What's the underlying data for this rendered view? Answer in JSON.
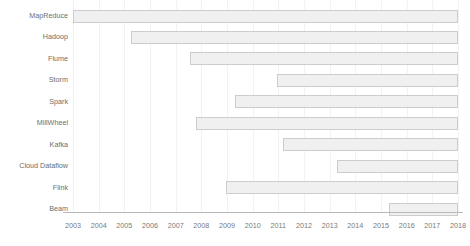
{
  "chart_data": {
    "type": "bar",
    "subtype": "gantt-timeline",
    "title": "",
    "subtitle": "",
    "xlabel": "",
    "ylabel": "",
    "orientation": "horizontal",
    "grid": true,
    "legend": false,
    "legend_position": "none",
    "xlim": [
      2002.4,
      2018.6
    ],
    "xticks": [
      2003,
      2004,
      2005,
      2006,
      2007,
      2008,
      2009,
      2010,
      2011,
      2012,
      2013,
      2014,
      2015,
      2016,
      2017,
      2018
    ],
    "xtick_labels": [
      "2003",
      "2004",
      "2005",
      "2006",
      "2007",
      "2008",
      "2009",
      "2010",
      "2011",
      "2012",
      "2013",
      "2014",
      "2015",
      "2016",
      "2017",
      "2018"
    ],
    "categories": [
      "MapReduce",
      "Hadoop",
      "Flume",
      "Storm",
      "Spark",
      "MillWheel",
      "Kafka",
      "Cloud Dataflow",
      "Flink",
      "Beam"
    ],
    "bar_color": "#f0f0f0",
    "bar_border_color": "#cccccc",
    "grid_color": "#f2f2f2",
    "axis_color": "#b9b9b9",
    "label_color": "#6d6d6d",
    "bars": [
      {
        "label": "MapReduce",
        "start": 2003.0,
        "end": 2018.0
      },
      {
        "label": "Hadoop",
        "start": 2005.25,
        "end": 2018.0
      },
      {
        "label": "Flume",
        "start": 2007.55,
        "end": 2018.0
      },
      {
        "label": "Storm",
        "start": 2010.95,
        "end": 2018.0
      },
      {
        "label": "Spark",
        "start": 2009.3,
        "end": 2018.0
      },
      {
        "label": "MillWheel",
        "start": 2007.8,
        "end": 2018.0
      },
      {
        "label": "Kafka",
        "start": 2011.2,
        "end": 2018.0
      },
      {
        "label": "Cloud Dataflow",
        "start": 2013.3,
        "end": 2018.0
      },
      {
        "label": "Flink",
        "start": 2008.95,
        "end": 2018.0
      },
      {
        "label": "Beam",
        "start": 2015.3,
        "end": 2018.0
      }
    ]
  }
}
